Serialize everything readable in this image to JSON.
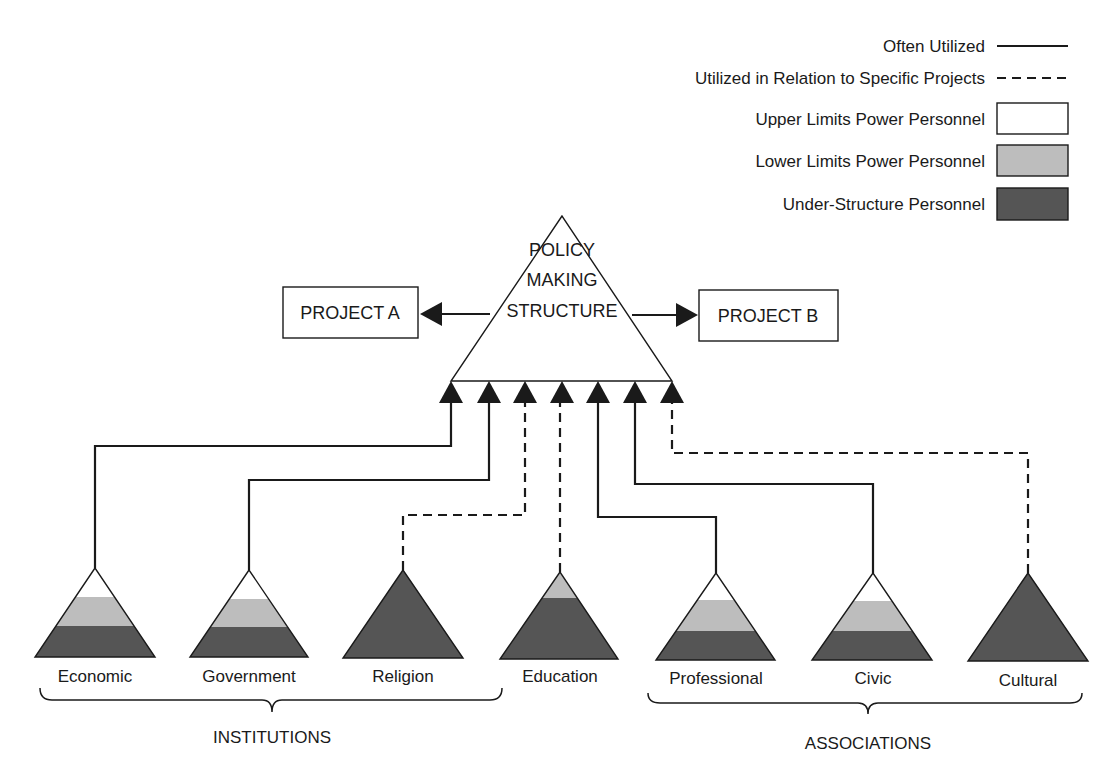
{
  "colors": {
    "upper": "#ffffff",
    "lower": "#bdbdbd",
    "under": "#555555",
    "ink": "#1a1a1a"
  },
  "legend": {
    "often_utilized": "Often Utilized",
    "specific_projects": "Utilized in Relation to Specific Projects",
    "upper_limits": "Upper Limits Power Personnel",
    "lower_limits": "Lower Limits Power Personnel",
    "under_structure": "Under-Structure Personnel"
  },
  "center": {
    "line1": "POLICY",
    "line2": "MAKING",
    "line3": "STRUCTURE"
  },
  "projects": {
    "a": "PROJECT A",
    "b": "PROJECT B"
  },
  "groups": {
    "institutions": "INSTITUTIONS",
    "associations": "ASSOCIATIONS"
  },
  "nodes": [
    {
      "label": "Economic",
      "link": "solid",
      "composition": [
        "upper",
        "lower",
        "under"
      ]
    },
    {
      "label": "Government",
      "link": "solid",
      "composition": [
        "upper",
        "lower",
        "under"
      ]
    },
    {
      "label": "Religion",
      "link": "dashed",
      "composition": [
        "under"
      ]
    },
    {
      "label": "Education",
      "link": "dashed",
      "composition": [
        "lower",
        "under"
      ]
    },
    {
      "label": "Professional",
      "link": "solid",
      "composition": [
        "upper",
        "lower",
        "under"
      ]
    },
    {
      "label": "Civic",
      "link": "solid",
      "composition": [
        "upper",
        "lower",
        "under"
      ]
    },
    {
      "label": "Cultural",
      "link": "dashed",
      "composition": [
        "under"
      ]
    }
  ]
}
